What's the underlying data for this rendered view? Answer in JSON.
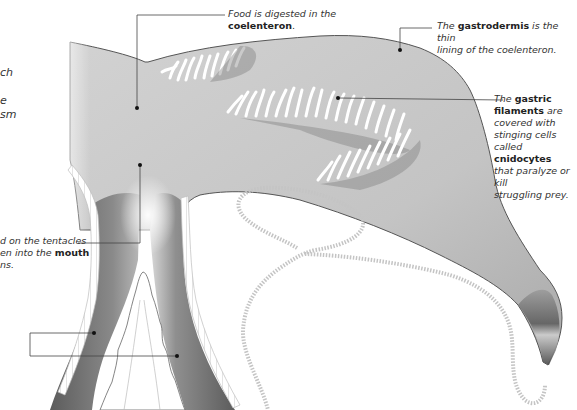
{
  "diagram": {
    "colors": {
      "body": "#c8c8c8",
      "body_dark": "#6a6a6a",
      "outline": "#555555",
      "leader_line": "#444444",
      "cell_layer": "#bdbdbd",
      "background": "#ffffff"
    }
  },
  "labels": {
    "coelenteron": {
      "line1": "Food is digested in the",
      "term": "coelenteron",
      "suffix": "."
    },
    "gastrodermis": {
      "pre": "The",
      "term": "gastrodermis",
      "post": "is the thin",
      "line2": "lining of the coelenteron."
    },
    "gastric_filaments": {
      "pre": "The",
      "term1a": "gastric",
      "term1b": "filaments",
      "line2post": "are",
      "line3": "covered with",
      "line4": "stinging cells",
      "line5pre": "called",
      "term2": "cnidocytes",
      "line6": "that paralyze or kill",
      "line7": "struggling prey."
    },
    "left_top_partial": {
      "line1": "ch",
      "line2": "e",
      "line3": "sm"
    },
    "mouth_partial": {
      "line1": "d on the tentacles",
      "line2pre": "en into the",
      "term": "mouth",
      "line3": "ns."
    }
  },
  "icons": {
    "leader_dot": "pointer-dot"
  }
}
